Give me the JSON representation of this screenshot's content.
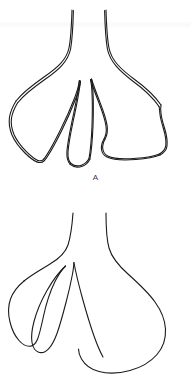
{
  "document": {
    "type": "line-drawing-figure",
    "background_color": "#ffffff",
    "ink_color": "#1b1b1b",
    "width": 191,
    "height": 389,
    "panel_count": 2
  },
  "panels": [
    {
      "id": "A",
      "label": "A",
      "label_x": 93,
      "label_y": 178,
      "style": "double-outline",
      "description": "Trifurcated lobed outline drawn with doubled contour lines: a narrow vertical stem splitting into a left lobe, a slender central lobe and a broad right lobe.",
      "stroke_color": "#1b1b1b",
      "stroke_width": 1.1,
      "lobes": [
        {
          "name": "left-lobe",
          "shape": "elongated-tapered",
          "direction": "down-left"
        },
        {
          "name": "center-lobe",
          "shape": "narrow-spike",
          "direction": "down"
        },
        {
          "name": "right-lobe",
          "shape": "broad-rounded",
          "direction": "down-right"
        }
      ],
      "stem": {
        "name": "upper-stem",
        "shape": "narrow-flaring-neck",
        "direction": "up"
      }
    },
    {
      "id": "B",
      "label": "B",
      "label_x": 93,
      "label_y": 379,
      "style": "single-outline",
      "description": "Single-contour outline: a narrow neck at the top dividing into two slender finger lobes on the left and one large balloon-shaped lobe on the right.",
      "stroke_color": "#1b1b1b",
      "stroke_width": 1.1,
      "lobes": [
        {
          "name": "left-finger-lobe-outer",
          "shape": "slender-finger",
          "direction": "down-left"
        },
        {
          "name": "left-finger-lobe-inner",
          "shape": "slender-finger",
          "direction": "down-left"
        },
        {
          "name": "right-balloon-lobe",
          "shape": "large-rounded-balloon",
          "direction": "down-right"
        }
      ],
      "stem": {
        "name": "upper-stem",
        "shape": "narrow-flaring-neck",
        "direction": "up"
      }
    }
  ],
  "labels": {
    "panel_a": "A",
    "panel_b": "B"
  }
}
